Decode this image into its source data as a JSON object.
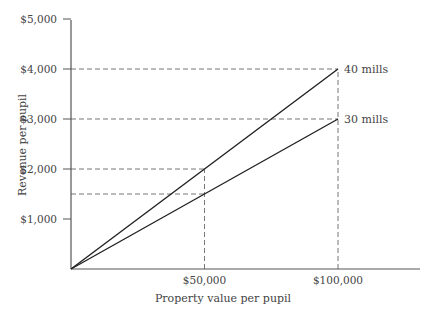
{
  "chart_data": {
    "type": "line",
    "title": "",
    "xlabel": "Property value per pupil",
    "ylabel": "Revenue per pupil",
    "xlim": [
      0,
      130000
    ],
    "ylim": [
      0,
      5000
    ],
    "grid": false,
    "x_ticks": [
      {
        "value": 50000,
        "label": "$50,000"
      },
      {
        "value": 100000,
        "label": "$100,000"
      }
    ],
    "y_ticks": [
      {
        "value": 1000,
        "label": "$1,000"
      },
      {
        "value": 2000,
        "label": "$2,000"
      },
      {
        "value": 3000,
        "label": "$3,000"
      },
      {
        "value": 4000,
        "label": "$4,000"
      },
      {
        "value": 5000,
        "label": "$5,000"
      }
    ],
    "series": [
      {
        "name": "40 mills",
        "x": [
          0,
          100000
        ],
        "y": [
          0,
          4000
        ]
      },
      {
        "name": "30 mills",
        "x": [
          0,
          100000
        ],
        "y": [
          0,
          3000
        ]
      }
    ],
    "reference_lines": [
      {
        "orientation": "horizontal",
        "y": 4000,
        "x_end": 100000
      },
      {
        "orientation": "horizontal",
        "y": 3000,
        "x_end": 100000
      },
      {
        "orientation": "horizontal",
        "y": 2000,
        "x_end": 50000
      },
      {
        "orientation": "horizontal",
        "y": 1500,
        "x_end": 50000
      },
      {
        "orientation": "vertical",
        "x": 50000,
        "y_end": 2000
      },
      {
        "orientation": "vertical",
        "x": 100000,
        "y_end": 4000
      }
    ],
    "legend": "inline labels at line ends"
  }
}
